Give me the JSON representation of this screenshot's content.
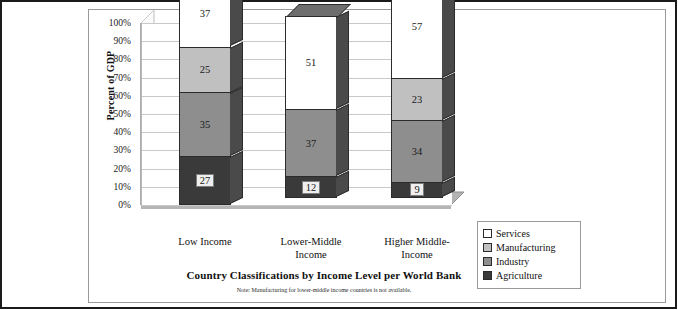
{
  "chart_data": {
    "type": "bar",
    "subtype": "stacked-column-3d",
    "title": "Country Classifications by Income Level per World Bank",
    "xlabel": "Country Classifications by Income Level per World Bank",
    "ylabel": "Percent of GDP",
    "ylim": [
      0,
      100
    ],
    "grid": true,
    "legend_position": "right-bottom",
    "note": "Note: Manufacturing for lower-middle income countries is not available.",
    "categories": [
      "Low Income",
      "Lower-Middle Income",
      "Higher Middle-Income"
    ],
    "category_lines": [
      [
        "Low Income"
      ],
      [
        "Lower-Middle",
        "Income"
      ],
      [
        "Higher Middle-",
        "Income"
      ]
    ],
    "ytick_labels": [
      "100%",
      "90%",
      "80%",
      "70%",
      "60%",
      "50%",
      "40%",
      "30%",
      "20%",
      "10%",
      "0%"
    ],
    "ytick_values": [
      100,
      90,
      80,
      70,
      60,
      50,
      40,
      30,
      20,
      10,
      0
    ],
    "series": [
      {
        "name": "Services",
        "color": "#ffffff",
        "values": [
          37,
          51,
          57
        ]
      },
      {
        "name": "Manufacturing",
        "color": "#c0c0c0",
        "values": [
          25,
          null,
          23
        ]
      },
      {
        "name": "Industry",
        "color": "#8e8e8e",
        "values": [
          35,
          37,
          34
        ]
      },
      {
        "name": "Agriculture",
        "color": "#3a3a3a",
        "values": [
          27,
          12,
          9
        ]
      }
    ],
    "bars": [
      {
        "category": "Low Income",
        "segments": [
          {
            "name": "Agriculture",
            "value": 27,
            "label": "27",
            "class": "c-agriculture",
            "dark": true
          },
          {
            "name": "Industry",
            "value": 35,
            "label": "35",
            "class": "c-industry",
            "dark": false
          },
          {
            "name": "Manufacturing",
            "value": 25,
            "label": "25",
            "class": "c-manufacturing",
            "dark": false
          },
          {
            "name": "Services",
            "value": 37,
            "label": "37",
            "class": "c-services",
            "dark": false
          }
        ]
      },
      {
        "category": "Lower-Middle Income",
        "segments": [
          {
            "name": "Agriculture",
            "value": 12,
            "label": "12",
            "class": "c-agriculture",
            "dark": true
          },
          {
            "name": "Industry",
            "value": 37,
            "label": "37",
            "class": "c-industry",
            "dark": false
          },
          {
            "name": "Services",
            "value": 51,
            "label": "51",
            "class": "c-services",
            "dark": false
          }
        ]
      },
      {
        "category": "Higher Middle-Income",
        "segments": [
          {
            "name": "Agriculture",
            "value": 9,
            "label": "9",
            "class": "c-agriculture",
            "dark": true
          },
          {
            "name": "Industry",
            "value": 34,
            "label": "34",
            "class": "c-industry",
            "dark": false
          },
          {
            "name": "Manufacturing",
            "value": 23,
            "label": "23",
            "class": "c-manufacturing",
            "dark": false
          },
          {
            "name": "Services",
            "value": 57,
            "label": "57",
            "class": "c-services",
            "dark": false
          }
        ]
      }
    ],
    "legend": [
      {
        "label": "Services",
        "color": "#ffffff"
      },
      {
        "label": "Manufacturing",
        "color": "#c0c0c0"
      },
      {
        "label": "Industry",
        "color": "#8e8e8e"
      },
      {
        "label": "Agriculture",
        "color": "#3a3a3a"
      }
    ],
    "colors": {
      "floor": "#b5b5b5",
      "sidewall": "#f2f2f2",
      "backwall": "#ffffff",
      "gridline": "#c9c9c9",
      "bar_right_face": "#4a4a4a",
      "bar_top_cap": "#6e6e6e",
      "border": "#1a1a1a"
    }
  }
}
